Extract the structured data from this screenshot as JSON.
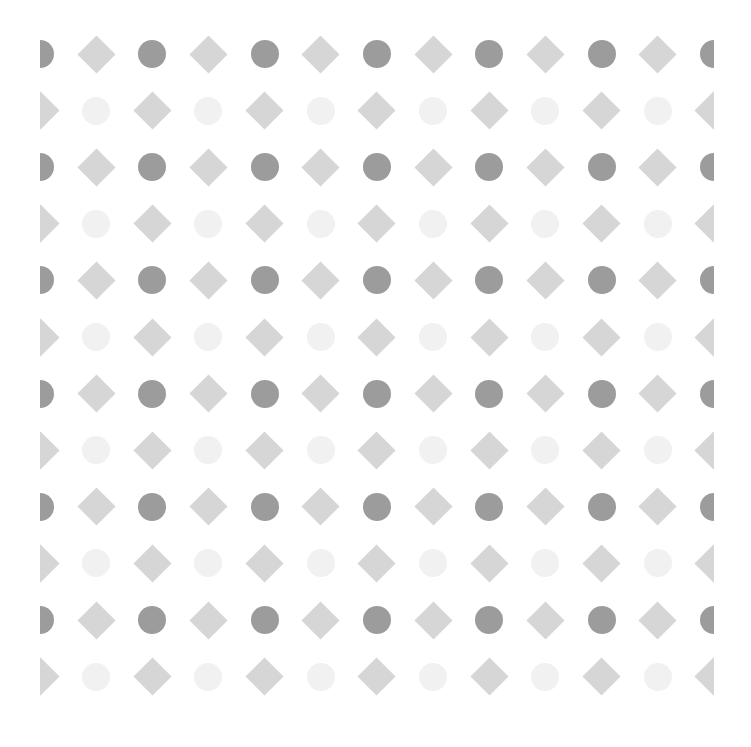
{
  "pattern": {
    "description": "Decorative polka pattern of alternating circles and diamonds",
    "columns": 13,
    "rows": 12,
    "pitch_x": 56.15,
    "pitch_y": 56.6,
    "colors": {
      "background": "#ffffff",
      "circle_dark": "#9c9c9c",
      "diamond": "#d6d6d6",
      "circle_faint": "#f1f1f1"
    },
    "row_types": {
      "even": [
        "circle_dark",
        "diamond"
      ],
      "odd": [
        "diamond",
        "circle_faint"
      ]
    }
  }
}
